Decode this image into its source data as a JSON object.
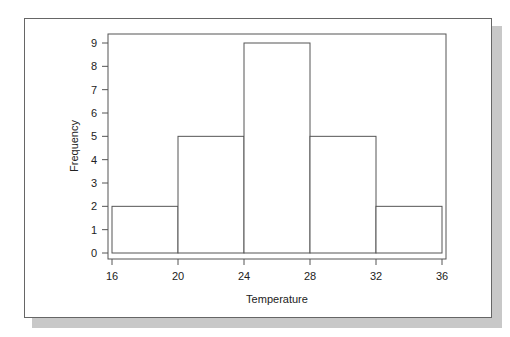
{
  "chart_data": {
    "type": "bar",
    "subtype": "histogram",
    "title": "",
    "xlabel": "Temperature",
    "ylabel": "Frequency",
    "bin_edges": [
      16,
      20,
      24,
      28,
      32,
      36
    ],
    "categories": [
      "16-20",
      "20-24",
      "24-28",
      "28-32",
      "32-36"
    ],
    "values": [
      2,
      5,
      9,
      5,
      2
    ],
    "x_ticks": [
      "16",
      "20",
      "24",
      "28",
      "32",
      "36"
    ],
    "y_ticks": [
      "0",
      "1",
      "2",
      "3",
      "4",
      "5",
      "6",
      "7",
      "8",
      "9"
    ],
    "xlim": [
      16,
      36
    ],
    "ylim": [
      0,
      9
    ],
    "grid": false,
    "legend": null
  }
}
